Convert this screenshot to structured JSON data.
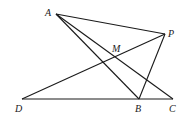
{
  "diagram": {
    "type": "geometry",
    "points": {
      "A": {
        "label": "A",
        "x": 56,
        "y": 14
      },
      "P": {
        "label": "P",
        "x": 165,
        "y": 34
      },
      "M": {
        "label": "M",
        "x": 114,
        "y": 57
      },
      "D": {
        "label": "D",
        "x": 22,
        "y": 99
      },
      "B": {
        "label": "B",
        "x": 139,
        "y": 99
      },
      "C": {
        "label": "C",
        "x": 173,
        "y": 99
      }
    },
    "segments": [
      [
        "A",
        "P"
      ],
      [
        "A",
        "B"
      ],
      [
        "A",
        "C"
      ],
      [
        "P",
        "D"
      ],
      [
        "P",
        "B"
      ],
      [
        "D",
        "C"
      ]
    ],
    "labels": {
      "A": "A",
      "P": "P",
      "M": "M",
      "D": "D",
      "B": "B",
      "C": "C"
    }
  }
}
